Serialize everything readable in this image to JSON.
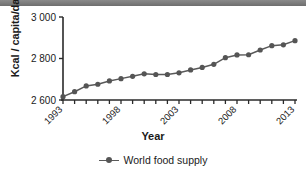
{
  "chart_data": {
    "type": "line",
    "title": "",
    "xlabel": "Year",
    "ylabel": "Kcal / capita/day",
    "xlim": [
      1993,
      2013
    ],
    "ylim": [
      2600,
      3000
    ],
    "yticks": [
      "2 600",
      "2 800",
      "3 000"
    ],
    "ytick_values": [
      2600,
      2800,
      3000
    ],
    "xticks_labeled": [
      "1993",
      "1998",
      "2003",
      "2008",
      "2013"
    ],
    "xtick_values": [
      1993,
      1994,
      1995,
      1996,
      1997,
      1998,
      1999,
      2000,
      2001,
      2002,
      2003,
      2004,
      2005,
      2006,
      2007,
      2008,
      2009,
      2010,
      2011,
      2012,
      2013
    ],
    "grid": false,
    "legend_position": "bottom-center",
    "series": [
      {
        "name": "World food supply",
        "color": "#595959",
        "marker": "circle",
        "x": [
          1993,
          1994,
          1995,
          1996,
          1997,
          1998,
          1999,
          2000,
          2001,
          2002,
          2003,
          2004,
          2005,
          2006,
          2007,
          2008,
          2009,
          2010,
          2011,
          2012,
          2013
        ],
        "values": [
          2616,
          2640,
          2668,
          2676,
          2692,
          2703,
          2714,
          2726,
          2723,
          2723,
          2731,
          2745,
          2757,
          2772,
          2804,
          2817,
          2818,
          2841,
          2862,
          2866,
          2886
        ]
      }
    ]
  },
  "legend": {
    "symbol_name": "line-marker-symbol",
    "label": "World food supply"
  },
  "axes": {
    "x_title": "Year",
    "y_title": "Kcal / capita/day"
  },
  "colors": {
    "line": "#595959",
    "marker": "#555555",
    "axis": "#2a2a2a",
    "top_bar": "#7a7a7a"
  }
}
